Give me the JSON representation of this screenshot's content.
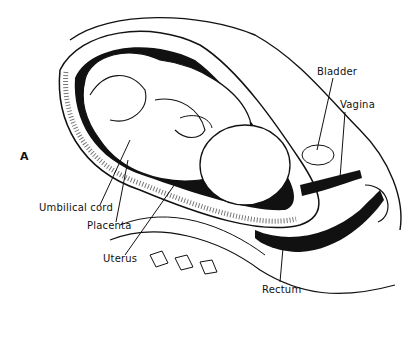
{
  "figure": {
    "panel_letter": "A",
    "labels": {
      "bladder": "Bladder",
      "vagina": "Vagina",
      "umbilical_cord": "Umbilical cord",
      "placenta": "Placenta",
      "uterus": "Uterus",
      "rectum": "Rectum"
    }
  }
}
